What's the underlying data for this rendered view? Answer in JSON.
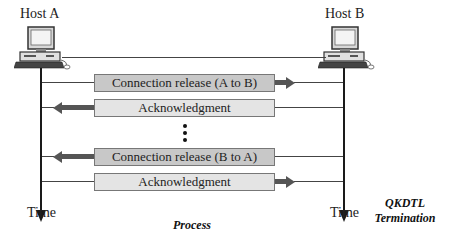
{
  "hosts": [
    {
      "label": "Host A",
      "icon": "desktop-computer-icon"
    },
    {
      "label": "Host B",
      "icon": "desktop-computer-icon"
    }
  ],
  "messages": [
    {
      "label": "Connection release (A to B)",
      "direction": "A-to-B",
      "shade": "dark"
    },
    {
      "label": "Acknowledgment",
      "direction": "B-to-A",
      "shade": "light"
    },
    {
      "label": "Connection release (B to A)",
      "direction": "B-to-A",
      "shade": "dark"
    },
    {
      "label": "Acknowledgment",
      "direction": "A-to-B",
      "shade": "light"
    }
  ],
  "ellipsis": "vertical-dots",
  "time_labels": [
    "Time",
    "Time"
  ],
  "captions": {
    "process": "Process",
    "qkdtl_line1": "QKDTL",
    "qkdtl_line2": "Termination"
  },
  "colors": {
    "box_dark": "#c8c8c8",
    "box_light": "#e4e4e4",
    "arrow": "#555555",
    "line": "#1a1a1a"
  }
}
